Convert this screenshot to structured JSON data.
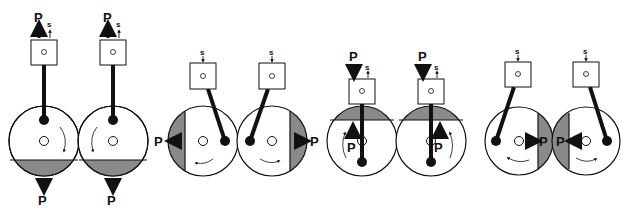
{
  "diagram": {
    "type": "gear pump / crank mechanism stages",
    "colors": {
      "line": "#111111",
      "shade": "#8a8a8a",
      "background": "#ffffff"
    },
    "labels": {
      "pressure": "P",
      "stroke": "s"
    },
    "stages": [
      {
        "name": "stage-1-downward-discharge",
        "piston_force": "up",
        "stroke_dir": "up",
        "gears": [
          {
            "cx": 44,
            "cy": 141,
            "rotation": "clockwise",
            "shade": "bottom",
            "output": "down"
          },
          {
            "cx": 113,
            "cy": 141,
            "rotation": "counterclockwise",
            "shade": "bottom",
            "output": "down"
          }
        ]
      },
      {
        "name": "stage-2-lateral-discharge",
        "piston_force": "none",
        "stroke_dir": "down",
        "gears": [
          {
            "cx": 203,
            "cy": 141,
            "rotation": "counterclockwise",
            "shade": "left",
            "output": "left"
          },
          {
            "cx": 272,
            "cy": 141,
            "rotation": "clockwise",
            "shade": "right",
            "output": "right"
          }
        ]
      },
      {
        "name": "stage-3-upward-pressure",
        "piston_force": "down",
        "stroke_dir": "up",
        "gears": [
          {
            "cx": 362,
            "cy": 141,
            "rotation": "counterclockwise",
            "shade": "top",
            "output": "up"
          },
          {
            "cx": 431,
            "cy": 141,
            "rotation": "clockwise",
            "shade": "top",
            "output": "up"
          }
        ]
      },
      {
        "name": "stage-4-inward-discharge",
        "piston_force": "none",
        "stroke_dir": "down",
        "gears": [
          {
            "cx": 519,
            "cy": 141,
            "rotation": "counterclockwise",
            "shade": "right",
            "output": "inward"
          },
          {
            "cx": 586,
            "cy": 141,
            "rotation": "clockwise",
            "shade": "left",
            "output": "inward"
          }
        ]
      }
    ]
  }
}
